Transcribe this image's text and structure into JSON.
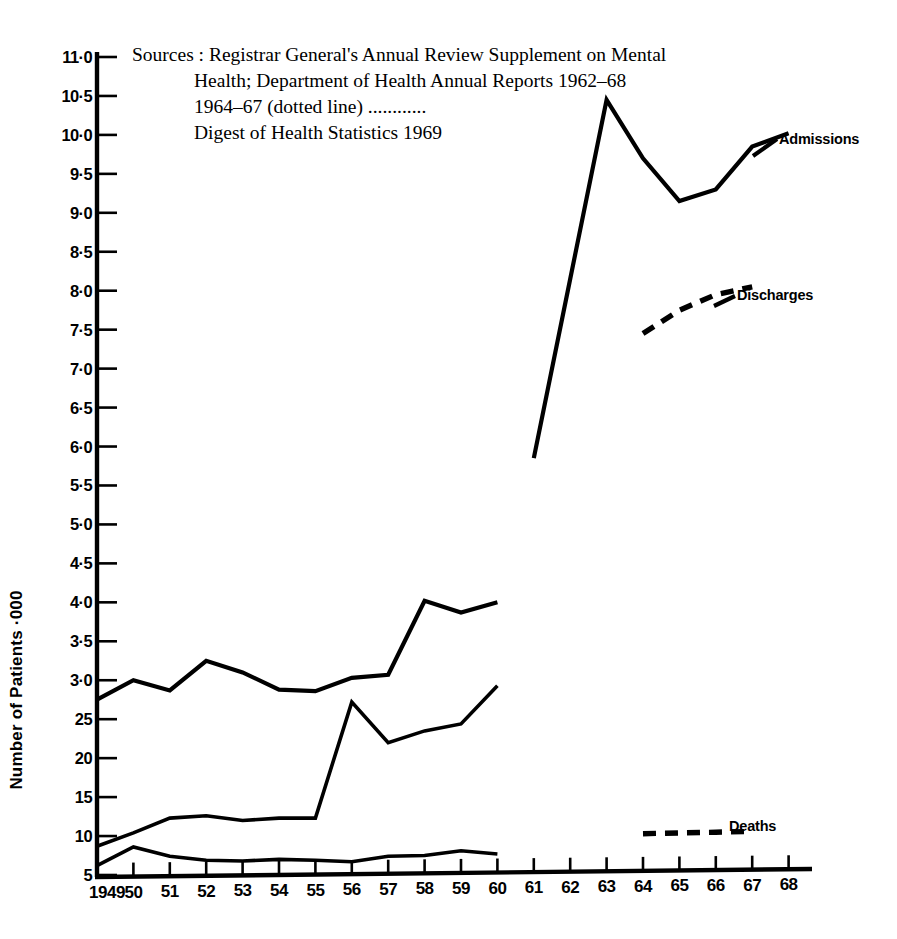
{
  "chart_data": {
    "type": "line",
    "title": "",
    "xlabel": "",
    "ylabel": "Number of Patients ·000",
    "xlim": [
      1949,
      1968
    ],
    "ylim": [
      5,
      110
    ],
    "grid": false,
    "legend_position": "inline-right-of-series",
    "y_ticks": [
      "5",
      "10",
      "15",
      "20",
      "25",
      "30",
      "35",
      "40",
      "45",
      "50",
      "55",
      "60",
      "65",
      "70",
      "75",
      "80",
      "85",
      "90",
      "95",
      "100",
      "105",
      "110"
    ],
    "y_tick_labels": [
      "5",
      "10",
      "15",
      "20",
      "25",
      "30",
      "35",
      "40",
      "45",
      "5·0",
      "5·5",
      "6·0",
      "6·5",
      "7·0",
      "7·5",
      "8·0",
      "8·5",
      "9·0",
      "9·5",
      "10·0",
      "10·5",
      "11·0"
    ],
    "y_tick_display": [
      "5",
      "10",
      "15",
      "20",
      "25",
      "3·0",
      "3·5",
      "4·0",
      "4·5",
      "5·0",
      "5·5",
      "6·0",
      "6·5",
      "7·0",
      "7·5",
      "8·0",
      "8·5",
      "9·0",
      "9·5",
      "10·0",
      "10·5",
      "11·0"
    ],
    "y_tick_values": [
      5,
      10,
      15,
      20,
      25,
      30,
      35,
      40,
      45,
      50,
      55,
      60,
      65,
      70,
      75,
      80,
      85,
      90,
      95,
      100,
      105,
      110
    ],
    "x_tick_labels": [
      "1949",
      "50",
      "51",
      "52",
      "53",
      "54",
      "55",
      "56",
      "57",
      "58",
      "59",
      "60",
      "61",
      "62",
      "63",
      "64",
      "65",
      "66",
      "67",
      "68"
    ],
    "x_tick_values": [
      1949,
      1950,
      1951,
      1952,
      1953,
      1954,
      1955,
      1956,
      1957,
      1958,
      1959,
      1960,
      1961,
      1962,
      1963,
      1964,
      1965,
      1966,
      1967,
      1968
    ],
    "series": [
      {
        "name": "Admissions",
        "style": "solid",
        "label": "Admissions",
        "x": [
          1961,
          1962,
          1963,
          1964,
          1965,
          1966,
          1967,
          1968
        ],
        "values": [
          58.5,
          81.5,
          104.5,
          97.0,
          91.5,
          93.0,
          98.5,
          100.2
        ]
      },
      {
        "name": "Discharges",
        "style": "dotted",
        "label": "Discharges",
        "x": [
          1964,
          1965,
          1966,
          1967
        ],
        "values": [
          74.5,
          77.5,
          79.5,
          80.5
        ]
      },
      {
        "name": "Deaths",
        "style": "dotted",
        "label": "Deaths",
        "x": [
          1964,
          1965,
          1966,
          1967
        ],
        "values": [
          10.3,
          10.4,
          10.5,
          10.6
        ]
      },
      {
        "name": "Series A (upper early)",
        "style": "solid",
        "label": "",
        "x": [
          1949,
          1950,
          1951,
          1952,
          1953,
          1954,
          1955,
          1956,
          1957,
          1958,
          1959,
          1960
        ],
        "values": [
          27.5,
          30.0,
          28.7,
          32.5,
          31.0,
          28.8,
          28.6,
          30.3,
          30.7,
          40.2,
          38.7,
          40.0
        ]
      },
      {
        "name": "Series B (middle early)",
        "style": "solid",
        "label": "",
        "x": [
          1949,
          1950,
          1951,
          1952,
          1953,
          1954,
          1955,
          1956,
          1957,
          1958,
          1959,
          1960
        ],
        "values": [
          8.7,
          10.4,
          12.3,
          12.6,
          12.0,
          12.3,
          12.3,
          27.2,
          22.0,
          23.5,
          24.4,
          29.3
        ]
      },
      {
        "name": "Series C (lower early)",
        "style": "solid",
        "label": "",
        "x": [
          1949,
          1950,
          1951,
          1952,
          1953,
          1954,
          1955,
          1956,
          1957,
          1958,
          1959,
          1960
        ],
        "values": [
          6.2,
          8.6,
          7.4,
          6.9,
          6.8,
          7.0,
          6.9,
          6.7,
          7.4,
          7.5,
          8.1,
          7.7
        ]
      }
    ],
    "annotations": [
      "Sources : Registrar General's Annual Review Supplement on Mental",
      "Health; Department of Health Annual Reports 1962–68",
      "1964–67 (dotted line) ............",
      "Digest of Health Statistics 1969"
    ]
  },
  "source_note": {
    "label": "Sources :",
    "line1": "Registrar General's Annual Review Supplement on Mental",
    "line2": "Health; Department of Health Annual Reports 1962–68",
    "line3": "1964–67 (dotted line) ............",
    "line4": "Digest of Health Statistics 1969"
  },
  "axis": {
    "y_title": "Number of Patients ·000"
  },
  "labels": {
    "admissions": "Admissions",
    "discharges": "Discharges",
    "deaths": "Deaths"
  },
  "colors": {
    "ink": "#000000",
    "paper": "#ffffff"
  }
}
